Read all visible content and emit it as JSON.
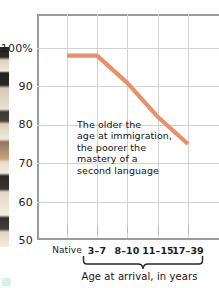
{
  "chart_data": {
    "type": "line",
    "title": "",
    "xlabel": "Age at arrival, in years",
    "ylabel": "",
    "categories": [
      "Native",
      "3–7",
      "8–10",
      "11–15",
      "17–39"
    ],
    "values": [
      98,
      98,
      91,
      82,
      75
    ],
    "ylim": [
      50,
      105
    ],
    "yticks": [
      50,
      60,
      70,
      80,
      90,
      100
    ],
    "ytick_labels": [
      "50",
      "60",
      "70",
      "80",
      "90",
      "100%"
    ],
    "grid": true,
    "legend": "none",
    "series_color": "#e8906b",
    "annotations": [
      {
        "lines": [
          "The older the",
          "age at immigration,",
          "the poorer the",
          "mastery of a",
          "second language"
        ]
      }
    ]
  },
  "axes": {
    "y_ticks": [
      {
        "label": "100%",
        "value": 100
      },
      {
        "label": "90",
        "value": 90
      },
      {
        "label": "80",
        "value": 80
      },
      {
        "label": "70",
        "value": 70
      },
      {
        "label": "60",
        "value": 60
      },
      {
        "label": "50",
        "value": 50
      }
    ],
    "x_ticks": [
      {
        "label": "Native"
      },
      {
        "label": "3–7"
      },
      {
        "label": "8–10"
      },
      {
        "label": "11–15"
      },
      {
        "label": "17–39"
      }
    ],
    "x_axis_caption": "Age at arrival, in years"
  },
  "colors": {
    "line": "#e8906b",
    "grid": "#d2d2d2",
    "axis": "#9a9a9a",
    "text": "#141414",
    "background": "#ffffff",
    "corner_mark": "#cfe9e0"
  }
}
